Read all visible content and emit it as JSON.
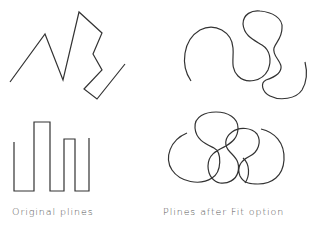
{
  "captions": {
    "original": "Original plines",
    "fitted": "Plines after Fit option"
  },
  "colors": {
    "stroke": "#333333",
    "text": "#555555",
    "background": "#ffffff"
  },
  "figures": [
    {
      "name": "zigzag-pline",
      "panel": "top-left",
      "kind": "original"
    },
    {
      "name": "zigzag-pline-fit",
      "panel": "top-right",
      "kind": "fitted"
    },
    {
      "name": "square-wave-pline",
      "panel": "bottom-left",
      "kind": "original"
    },
    {
      "name": "square-wave-pline-fit",
      "panel": "bottom-right",
      "kind": "fitted"
    }
  ]
}
